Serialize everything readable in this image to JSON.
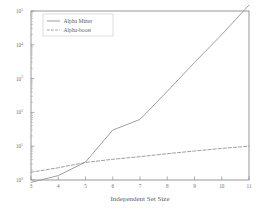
{
  "chart_data": {
    "type": "line",
    "title": "",
    "subtitle": "",
    "xlabel": "Independent Set Size",
    "ylabel": "",
    "xlim": [
      3,
      11
    ],
    "ylim": [
      0.7,
      300000
    ],
    "yscale": "log",
    "xscale": "linear",
    "grid": false,
    "legend_position": "top-left",
    "xticks": [
      3,
      4,
      5,
      6,
      7,
      8,
      9,
      10,
      11
    ],
    "xticklabels": [
      "3",
      "4",
      "5",
      "6",
      "7",
      "8",
      "9",
      "10",
      "11"
    ],
    "yticks": [
      1,
      10,
      100,
      1000,
      10000,
      100000
    ],
    "yticklabels": [
      "10^0",
      "10^1",
      "10^2",
      "10^3",
      "10^4",
      "10^5"
    ],
    "ytick_bases": [
      "10",
      "10",
      "10",
      "10",
      "10",
      "10"
    ],
    "ytick_exponents": [
      "0",
      "1",
      "2",
      "3",
      "4",
      "5"
    ],
    "x": [
      3,
      4,
      5,
      6,
      7,
      8,
      9,
      10,
      11
    ],
    "series": [
      {
        "name": "Alpha Miner",
        "style": "solid",
        "color": "#9a9a9a",
        "values": [
          0.85,
          1.35,
          3.4,
          30,
          62,
          420,
          3000,
          20000,
          150000
        ]
      },
      {
        "name": "Alpha-boost",
        "style": "dashed",
        "color": "#9a9a9a",
        "values": [
          1.7,
          2.3,
          3.3,
          4.1,
          4.9,
          6.0,
          7.2,
          8.6,
          10.0
        ]
      }
    ],
    "annotations": []
  },
  "legend": {
    "entries": [
      {
        "label": "Alpha Miner",
        "style": "solid"
      },
      {
        "label": "Alpha-boost",
        "style": "dashed"
      }
    ]
  },
  "axes": {
    "x_title": "Independent Set Size"
  }
}
